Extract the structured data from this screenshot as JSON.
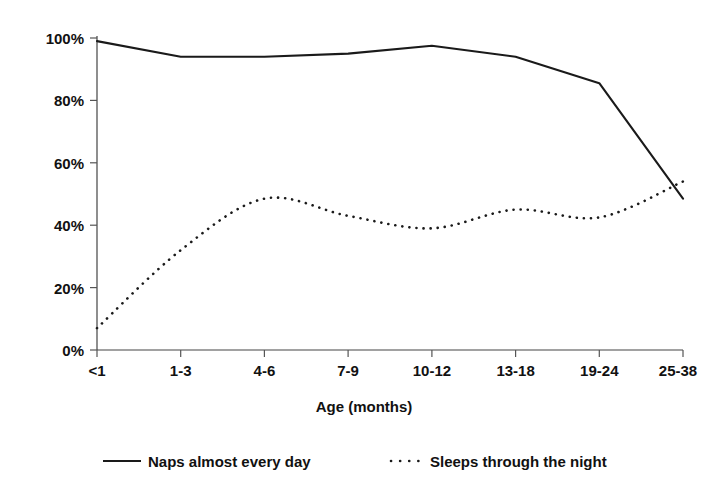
{
  "chart_data": {
    "type": "line",
    "title": "",
    "subtitle": "",
    "xlabel": "Age (months)",
    "ylabel": "",
    "categories": [
      "<1",
      "1-3",
      "4-6",
      "7-9",
      "10-12",
      "13-18",
      "19-24",
      "25-38"
    ],
    "ylim": [
      0,
      100
    ],
    "yticks": [
      0,
      20,
      40,
      60,
      80,
      100
    ],
    "ytick_labels": [
      "0%",
      "20%",
      "40%",
      "60%",
      "80%",
      "100%"
    ],
    "grid": false,
    "legend_position": "bottom",
    "series": [
      {
        "name": "Naps almost every day",
        "style": "solid",
        "values": [
          99,
          94,
          94,
          95,
          97.5,
          94,
          85.5,
          48.5
        ]
      },
      {
        "name": "Sleeps through the night",
        "style": "dotted",
        "values": [
          7,
          32,
          48.5,
          43,
          39,
          45,
          42.5,
          54
        ]
      }
    ]
  },
  "axes": {
    "x_title": "Age (months)",
    "x_tick_labels": [
      "<1",
      "1-3",
      "4-6",
      "7-9",
      "10-12",
      "13-18",
      "19-24",
      "25-38"
    ],
    "y_tick_labels": [
      "100%",
      "80%",
      "60%",
      "40%",
      "20%",
      "0%"
    ]
  },
  "legend": {
    "items": [
      {
        "label": "Naps almost every day",
        "style": "solid"
      },
      {
        "label": "Sleeps through the night",
        "style": "dotted"
      }
    ]
  },
  "colors": {
    "line": "#1a1a1a",
    "axis": "#444444",
    "text": "#111111",
    "background": "#ffffff"
  }
}
